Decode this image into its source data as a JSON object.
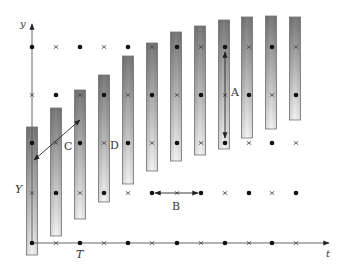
{
  "figure": {
    "width": 345,
    "height": 273,
    "colors": {
      "axis": "#555555",
      "marker": "#111111",
      "bar_dark": "#7a7a7a",
      "bar_light": "#f4f4f4",
      "bar_border": "#777777",
      "arrow": "#222222"
    },
    "axes": {
      "y_axis": {
        "x": 32,
        "y_top": 22,
        "y_bottom": 244,
        "label": "y",
        "label_x": 20,
        "label_y": 27
      },
      "t_axis": {
        "y": 243,
        "x_left": 32,
        "x_right": 331,
        "label": "t",
        "label_x": 326,
        "label_y": 257
      }
    },
    "grid": {
      "columns_x": [
        32,
        56,
        80,
        104,
        128,
        152,
        177,
        201,
        225,
        249,
        272,
        296
      ],
      "rows": [
        {
          "y": 47,
          "pattern_start": "dot"
        },
        {
          "y": 95,
          "pattern_start": "cross"
        },
        {
          "y": 143,
          "pattern_start": "dot"
        },
        {
          "y": 193,
          "pattern_start": "cross"
        },
        {
          "y": 243,
          "pattern_start": "dot"
        }
      ]
    },
    "bars": [
      {
        "x": 32,
        "top": 127,
        "bottom": 255
      },
      {
        "x": 56,
        "top": 108,
        "bottom": 236
      },
      {
        "x": 80,
        "top": 90,
        "bottom": 219
      },
      {
        "x": 104,
        "top": 75,
        "bottom": 202
      },
      {
        "x": 128,
        "top": 56,
        "bottom": 184
      },
      {
        "x": 152,
        "top": 43,
        "bottom": 171
      },
      {
        "x": 176,
        "top": 32,
        "bottom": 161
      },
      {
        "x": 200,
        "top": 26,
        "bottom": 155
      },
      {
        "x": 224,
        "top": 20,
        "bottom": 149
      },
      {
        "x": 247,
        "top": 17,
        "bottom": 138
      },
      {
        "x": 271,
        "top": 16,
        "bottom": 129
      },
      {
        "x": 295,
        "top": 17,
        "bottom": 120
      }
    ],
    "bar_width": 11,
    "arrows": [
      {
        "name": "A",
        "x1": 225,
        "y1": 52,
        "x2": 225,
        "y2": 138
      },
      {
        "name": "B",
        "x1": 155,
        "y1": 193,
        "x2": 198,
        "y2": 193
      },
      {
        "name": "C",
        "x1": 34,
        "y1": 160,
        "x2": 80,
        "y2": 120
      }
    ],
    "labels": [
      {
        "id": "A",
        "text": "A",
        "x": 231,
        "y": 96,
        "italic": false
      },
      {
        "id": "B",
        "text": "B",
        "x": 172,
        "y": 210,
        "italic": false
      },
      {
        "id": "C",
        "text": "C",
        "x": 64,
        "y": 150,
        "italic": false
      },
      {
        "id": "D",
        "text": "D",
        "x": 110,
        "y": 149,
        "italic": false
      },
      {
        "id": "Y",
        "text": "Y",
        "x": 15,
        "y": 193,
        "italic": true
      },
      {
        "id": "T",
        "text": "T",
        "x": 76,
        "y": 258,
        "italic": true
      }
    ]
  }
}
